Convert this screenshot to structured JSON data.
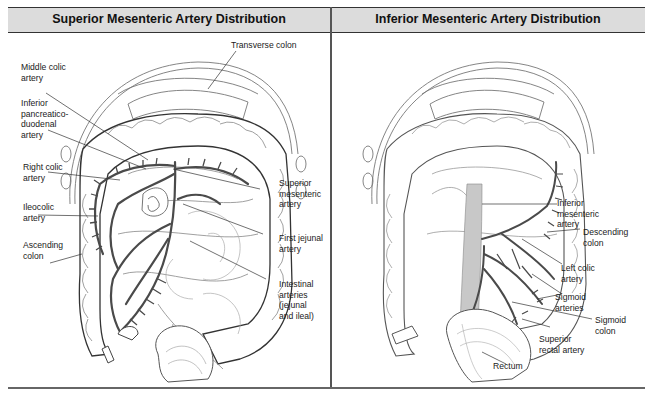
{
  "panels": {
    "left": {
      "title": "Superior Mesenteric Artery Distribution",
      "labels": {
        "middle_colic": "Middle colic\nartery",
        "inferior_pancreatico": "Inferior\npancreatico-\nduodenal\nartery",
        "right_colic": "Right colic\nartery",
        "ileocolic": "Ileocolic\nartery",
        "ascending_colon": "Ascending\ncolon",
        "transverse_colon": "Transverse colon",
        "superior_mesenteric": "Superior\nmesenteric\nartery",
        "first_jejunal": "First jejunal\nartery",
        "intestinal_arteries": "Intestinal\narteries\n(jejunal\nand ileal)"
      }
    },
    "right": {
      "title": "Inferior Mesenteric Artery Distribution",
      "labels": {
        "inferior_mesenteric": "Inferior\nmesenteric\nartery",
        "descending_colon": "Descending\ncolon",
        "left_colic": "Left colic\nartery",
        "sigmoid_arteries": "Sigmoid\narteries",
        "sigmoid_colon": "Sigmoid\ncolon",
        "superior_rectal": "Superior\nrectal artery",
        "rectum": "Rectum"
      }
    }
  },
  "colors": {
    "header_bg": "#dcdcdc",
    "artery": "#4a4a4a",
    "artery_fill": "#9a9a9a",
    "outline": "#6a6a6a"
  }
}
